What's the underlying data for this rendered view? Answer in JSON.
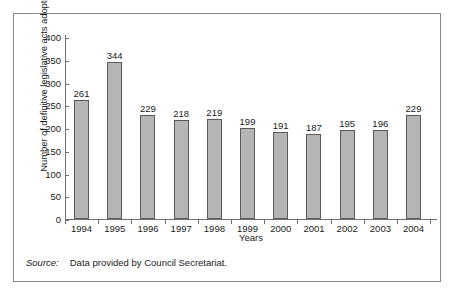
{
  "chart_data": {
    "type": "bar",
    "title": "",
    "xlabel": "Years",
    "ylabel": "Number of definitive legislative acts adopted",
    "categories": [
      "1994",
      "1995",
      "1996",
      "1997",
      "1998",
      "1999",
      "2000",
      "2001",
      "2002",
      "2003",
      "2004"
    ],
    "values": [
      261,
      344,
      229,
      218,
      219,
      199,
      191,
      187,
      195,
      196,
      229
    ],
    "data_labels": [
      "261",
      "344",
      "229",
      "218",
      "219",
      "199",
      "191",
      "187",
      "195",
      "196",
      "229"
    ],
    "ylim": [
      0,
      400
    ],
    "ytick_step": 50,
    "ytick_labels": [
      "0",
      "50",
      "100",
      "150",
      "200",
      "250",
      "300",
      "350",
      "400"
    ],
    "ytick_values": [
      0,
      50,
      100,
      150,
      200,
      250,
      300,
      350,
      400
    ],
    "grid": false,
    "legend": null,
    "bar_fill_color": "#b5b5b5",
    "bar_border_color": "#5a5a5a",
    "axis_color": "#707070",
    "frame_color": "#8a8a8a",
    "text_color": "#1a1a1a"
  },
  "source": {
    "label": "Source:",
    "text": "Data provided by Council Secretariat."
  }
}
